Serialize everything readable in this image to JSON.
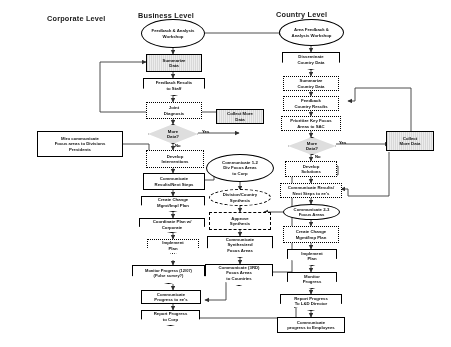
{
  "diagram": {
    "columns": [
      {
        "id": "corporate",
        "label": "Corporate Level"
      },
      {
        "id": "business",
        "label": "Business Level"
      },
      {
        "id": "country",
        "label": "Country Level"
      }
    ],
    "decision_labels": {
      "yes": "Yes",
      "no": "No"
    },
    "colors": {
      "line": "#3a3a3a",
      "shade_fill": "#dcdcdc",
      "hatch_fill": "#e2e2e2",
      "text": "#111111"
    }
  },
  "corporate_nodes": [
    {
      "id": "corp-communicate-focus",
      "shape": "rectangle-heavy",
      "label": "Miro communicate\nFocus areas to Divisions\nPresidents"
    }
  ],
  "business_nodes": [
    {
      "id": "biz-workshop",
      "shape": "oval",
      "label": "Feedback & Analysis\nWorkshop"
    },
    {
      "id": "biz-summarize",
      "shape": "rectangle-shaded",
      "label": "Summarize\nData"
    },
    {
      "id": "biz-feedback-staff",
      "shape": "pentagon",
      "label": "Feedback Results\nto Staff"
    },
    {
      "id": "biz-joint-diagnosis",
      "shape": "rectangle-dotted",
      "label": "Joint\nDiagnosis"
    },
    {
      "id": "biz-more-data",
      "shape": "diamond",
      "label": "More\nData?"
    },
    {
      "id": "biz-collect-more",
      "shape": "rectangle-shaded",
      "label": "Collect More\nData"
    },
    {
      "id": "biz-develop-interventions",
      "shape": "rectangle-dotted",
      "label": "Develop\nInterventions"
    },
    {
      "id": "biz-communicate-results",
      "shape": "rectangle-solid",
      "label": "Communicate\nResults/Next Steps"
    },
    {
      "id": "biz-create-change-plan",
      "shape": "pentagon",
      "label": "Create Change\nMgmt/Impl Plan"
    },
    {
      "id": "biz-coordinate-corp",
      "shape": "pentagon",
      "label": "Coordinate Plan w/\nCorporate"
    },
    {
      "id": "biz-implement-plan",
      "shape": "pentagon-dotted",
      "label": "Implement\nPlan"
    },
    {
      "id": "biz-monitor-progress",
      "shape": "pentagon",
      "label": "Monitor Progress (12/07)\n(Pulse survey?)"
    },
    {
      "id": "biz-communicate-ees",
      "shape": "rectangle-solid",
      "label": "Communicate\nProgress to ee's"
    },
    {
      "id": "biz-report-corp",
      "shape": "pentagon",
      "label": "Report Progress\nto Corp"
    }
  ],
  "middle_nodes": [
    {
      "id": "mid-communicate-div-focus",
      "shape": "oval",
      "label": "Communicate 1-2\nDiv Focus Areas\nto Corp"
    },
    {
      "id": "mid-div-country-synthesis",
      "shape": "oval-dashed",
      "label": "Division/Country\nSynthesis"
    },
    {
      "id": "mid-approve-synthesis",
      "shape": "rectangle-dashed",
      "label": "Approve\nSynthesis"
    },
    {
      "id": "mid-communicate-synth",
      "shape": "pentagon",
      "label": "Communicate\nSynthesized\nFocus Areas"
    },
    {
      "id": "mid-communicate-3rd",
      "shape": "pentagon",
      "label": "Communicate (3RD)\nFocus Areas\nto Countries"
    }
  ],
  "country_nodes": [
    {
      "id": "cty-area-workshop",
      "shape": "oval",
      "label": "Area Feedback &\nAnalysis Workshop"
    },
    {
      "id": "cty-disseminate",
      "shape": "pentagon",
      "label": "Disseminate\nCountry Data"
    },
    {
      "id": "cty-summarize",
      "shape": "rectangle-dotted",
      "label": "Summarize\nCountry Data"
    },
    {
      "id": "cty-feedback-results",
      "shape": "rectangle-dotted",
      "label": "Feedback\nCountry Results"
    },
    {
      "id": "cty-prioritize",
      "shape": "rectangle-dotted",
      "label": "Prioritize  Key Focus\nAreas to SAC"
    },
    {
      "id": "cty-more-data",
      "shape": "diamond",
      "label": "More\nData?"
    },
    {
      "id": "cty-collect-more",
      "shape": "rectangle-shaded",
      "label": "Collect\nMore Data"
    },
    {
      "id": "cty-develop-solutions",
      "shape": "rectangle-dotted",
      "label": "Develop\nSolutions"
    },
    {
      "id": "cty-communicate-results",
      "shape": "rectangle-dotted",
      "label": "Communicate Results/\nNext Steps to ee's"
    },
    {
      "id": "cty-communicate-focus",
      "shape": "oval",
      "label": "Communicate 2-3\nFocus Areas"
    },
    {
      "id": "cty-create-change-plan",
      "shape": "rectangle-dotted",
      "label": "Create Change\nMgmt/Imp Plan"
    },
    {
      "id": "cty-implement-plan",
      "shape": "pentagon",
      "label": "Implement\nPlan"
    },
    {
      "id": "cty-monitor-progress",
      "shape": "pentagon",
      "label": "Monitor\nProgress"
    },
    {
      "id": "cty-report-ld",
      "shape": "pentagon",
      "label": "Report Progress\nTo L&D Director"
    },
    {
      "id": "cty-communicate-employees",
      "shape": "rectangle-solid",
      "label": "Communicate\nprogress to Employees"
    }
  ]
}
